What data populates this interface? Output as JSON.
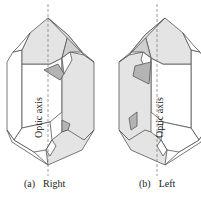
{
  "figure": {
    "panels": [
      {
        "id": "a",
        "tag": "(a)",
        "label": "Right",
        "axis_label": "Optic axis"
      },
      {
        "id": "b",
        "tag": "(b)",
        "label": "Left",
        "axis_label": "Optic axis"
      }
    ],
    "colors": {
      "light_face": "#e4e4e4",
      "mid_face": "#cfcfcf",
      "dark_face": "#b4b4b4",
      "edge": "#555555"
    }
  }
}
